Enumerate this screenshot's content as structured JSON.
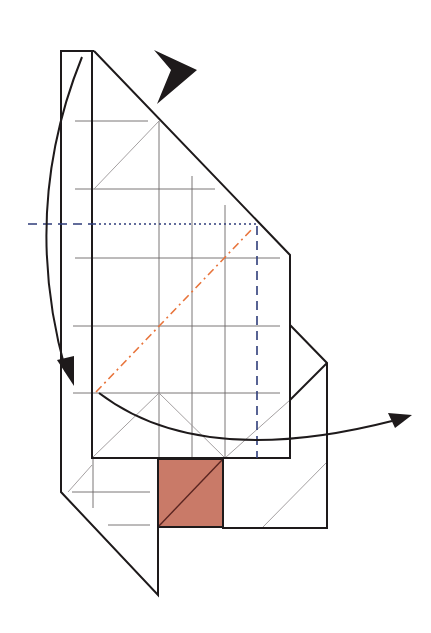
{
  "diagram": {
    "type": "origami-fold-step",
    "colors": {
      "edge": "#1e1a1b",
      "grid_line": "#6b6667",
      "valley_fold": "#2f3d7a",
      "mountain_fold": "#e8743b",
      "colored_side": "#c97a68",
      "background": "#ffffff"
    },
    "symbols": [
      {
        "name": "push-arrow",
        "description": "Solid black push/sink arrowhead at top"
      },
      {
        "name": "fold-down-arrow",
        "description": "Curved arrow on left pointing downward"
      },
      {
        "name": "fold-right-arrow",
        "description": "Curved arrow at bottom pointing right"
      }
    ],
    "fold_lines": [
      {
        "kind": "valley",
        "description": "Horizontal dashed blue line at left"
      },
      {
        "kind": "x-ray",
        "description": "Horizontal dotted blue line across body"
      },
      {
        "kind": "valley",
        "description": "Vertical dashed blue line at right"
      },
      {
        "kind": "mountain",
        "description": "Diagonal dash-dot orange line"
      }
    ],
    "colored_region": {
      "name": "colored-square",
      "description": "Reddish colored square showing reverse side"
    }
  }
}
